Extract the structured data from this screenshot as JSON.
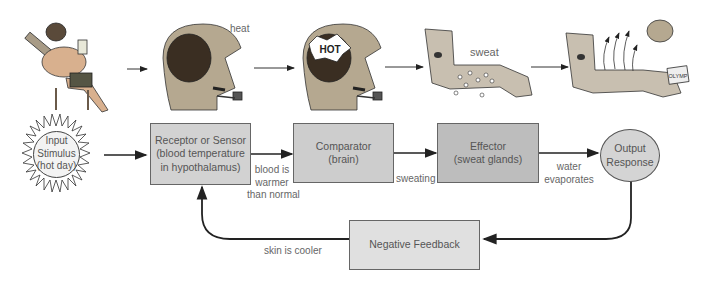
{
  "illustrations": {
    "panel_1": {
      "description": "man relaxing in lawn chair on hot day with drink and pipe"
    },
    "panel_2": {
      "description": "man's head with exposed brain",
      "caption": "heat"
    },
    "panel_3": {
      "description": "man's head with brain labeled HOT",
      "brain_label": "HOT"
    },
    "panel_4": {
      "description": "arm with sweat droplets",
      "caption": "sweat"
    },
    "panel_5": {
      "description": "arm with evaporation arrows holding a can",
      "can_label": "OLYMP"
    }
  },
  "nodes": {
    "input": {
      "line1": "Input",
      "line2": "Stimulus",
      "line3": "(hot day)"
    },
    "receptor": {
      "line1": "Receptor or Sensor",
      "line2": "(blood temperature",
      "line3": "in hypothalamus)"
    },
    "comparator": {
      "line1": "Comparator",
      "line2": "(brain)"
    },
    "effector": {
      "line1": "Effector",
      "line2": "(sweat glands)"
    },
    "output": {
      "line1": "Output",
      "line2": "Response"
    },
    "feedback": {
      "label": "Negative Feedback"
    }
  },
  "edge_labels": {
    "receptor_to_comparator": {
      "line1": "blood is",
      "line2": "warmer",
      "line3": "than normal"
    },
    "comparator_to_effector": "sweating",
    "effector_to_output": {
      "line1": "water",
      "line2": "evaporates"
    },
    "feedback_to_receptor": "skin is cooler"
  },
  "colors": {
    "box_fill": "#c9c9c9",
    "box_fill_light": "#e2e2e2",
    "circle_fill": "#d4d4d4",
    "line": "#222222",
    "text": "#555555"
  }
}
